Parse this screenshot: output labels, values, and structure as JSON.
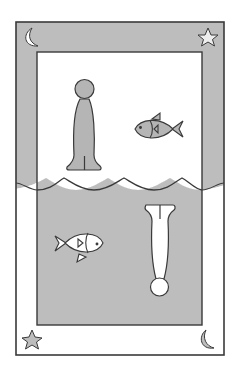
{
  "illustration": {
    "title": "Reflection card",
    "description": "Framed drawing split by a wavy water line: upper half shows an upright figure and a fish facing left on white with a gray frame band; lower half mirrors it with an inverted figure and a fish facing right on gray with a white frame band.",
    "colors": {
      "background": "#ffffff",
      "gray_fill": "#bdbdbd",
      "light_fill": "#ffffff",
      "outline": "#3a3a3a",
      "figure_gray": "#b5b5b5"
    },
    "top_half": {
      "frame_band": "gray",
      "panel": "white",
      "figure": {
        "name": "upright-figure",
        "fill": "gray"
      },
      "fish": {
        "name": "fish-facing-left",
        "fill": "gray"
      },
      "corner_icons": [
        "crescent-moon-icon",
        "star-icon"
      ]
    },
    "bottom_half": {
      "frame_band": "white",
      "panel": "gray",
      "figure": {
        "name": "inverted-figure",
        "fill": "white"
      },
      "fish": {
        "name": "fish-facing-right",
        "fill": "white"
      },
      "corner_icons": [
        "star-icon",
        "crescent-moon-icon"
      ]
    },
    "wave_line": {
      "crests": 4
    }
  }
}
